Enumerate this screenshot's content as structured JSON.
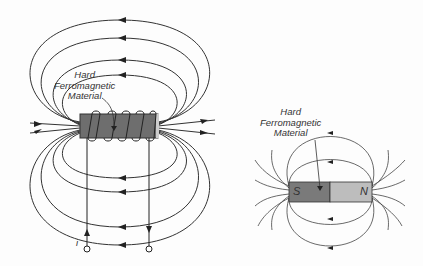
{
  "left_diagram": {
    "label_line1": "Hard",
    "label_line2": "Ferromagnetic",
    "label_line3": "Material",
    "current_label": "i",
    "magnet_color": "#6e6e6e"
  },
  "right_diagram": {
    "label_line1": "Hard",
    "label_line2": "Ferromagnetic",
    "label_line3": "Material",
    "south_label": "S",
    "north_label": "N",
    "south_color": "#7a7a7a",
    "north_color": "#bdbdbd"
  }
}
